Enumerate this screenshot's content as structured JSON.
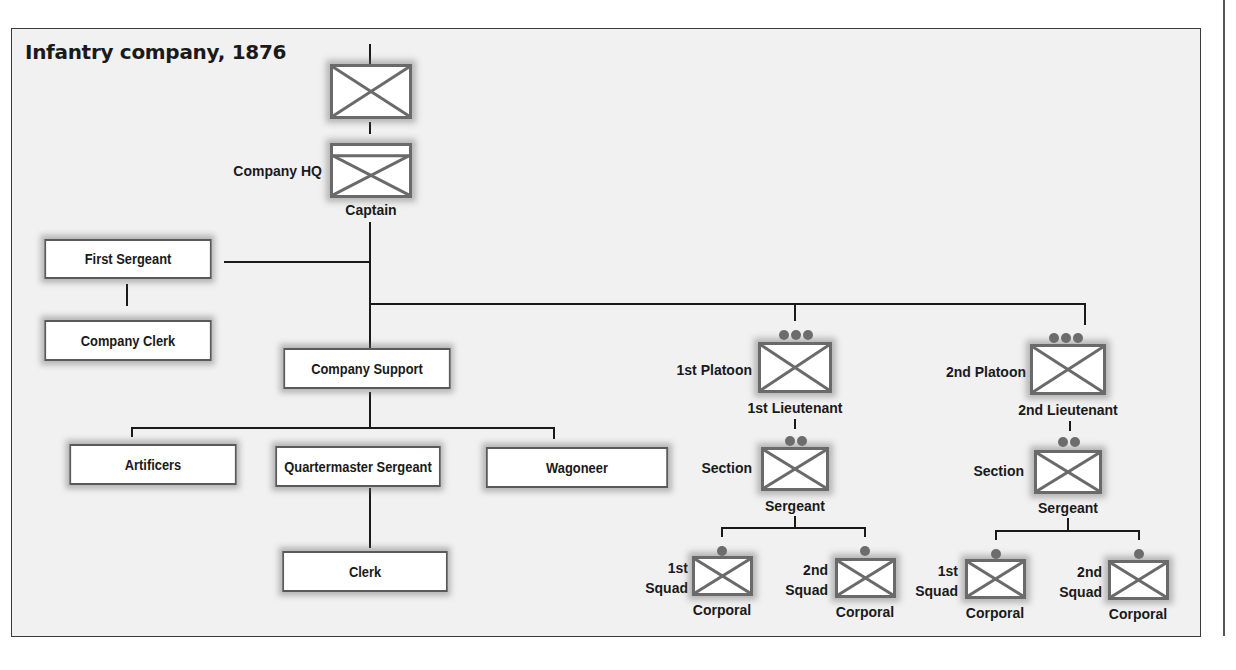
{
  "title": "Infantry company, 1876",
  "colors": {
    "frame_bg": "#f1f1f1",
    "line": "#1a1a1a",
    "box_border": "#5a5a5a",
    "rank_dot": "#6d6d6d"
  },
  "nodes": {
    "company": {
      "symbol": "infantry-unit-symbol"
    },
    "company_hq": {
      "label": "Company HQ",
      "rank": "Captain",
      "symbol": "infantry-hq-symbol"
    },
    "first_sergeant": {
      "label": "First Sergeant"
    },
    "company_clerk": {
      "label": "Company Clerk"
    },
    "company_support": {
      "label": "Company Support"
    },
    "artificers": {
      "label": "Artificers"
    },
    "quartermaster_sergeant": {
      "label": "Quartermaster Sergeant"
    },
    "wagoneer": {
      "label": "Wagoneer"
    },
    "clerk": {
      "label": "Clerk"
    },
    "platoon1": {
      "label": "1st Platoon",
      "rank": "1st  Lieutenant",
      "size_dots": 3
    },
    "platoon2": {
      "label": "2nd Platoon",
      "rank": "2nd  Lieutenant",
      "size_dots": 3
    },
    "section1": {
      "label": "Section",
      "rank": "Sergeant",
      "size_dots": 2
    },
    "section2": {
      "label": "Section",
      "rank": "Sergeant",
      "size_dots": 2
    },
    "p1_squad1": {
      "label_line1": "1st",
      "label_line2": "Squad",
      "rank": "Corporal",
      "size_dots": 1
    },
    "p1_squad2": {
      "label_line1": "2nd",
      "label_line2": "Squad",
      "rank": "Corporal",
      "size_dots": 1
    },
    "p2_squad1": {
      "label_line1": "1st",
      "label_line2": "Squad",
      "rank": "Corporal",
      "size_dots": 1
    },
    "p2_squad2": {
      "label_line1": "2nd",
      "label_line2": "Squad",
      "rank": "Corporal",
      "size_dots": 1
    }
  }
}
